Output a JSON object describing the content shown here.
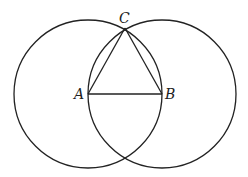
{
  "diagram": {
    "stroke_color": "#222222",
    "background": "#ffffff",
    "points": {
      "A": {
        "label": "A",
        "x": 88,
        "y": 94
      },
      "B": {
        "label": "B",
        "x": 162,
        "y": 94
      },
      "C": {
        "label": "C",
        "x": 125,
        "y": 28
      }
    },
    "circles": [
      {
        "name": "circle-centered-A",
        "cx": 88,
        "cy": 94,
        "r": 74
      },
      {
        "name": "circle-centered-B",
        "cx": 162,
        "cy": 94,
        "r": 74
      }
    ],
    "segments": [
      {
        "from": "A",
        "to": "B"
      },
      {
        "from": "A",
        "to": "C"
      },
      {
        "from": "B",
        "to": "C"
      }
    ]
  }
}
